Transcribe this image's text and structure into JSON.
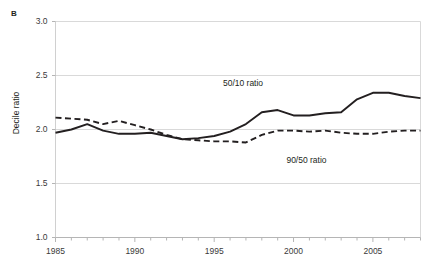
{
  "chart_data": {
    "type": "line",
    "title": "",
    "panel_label": "B",
    "xlabel": "",
    "ylabel": "Decile ratio",
    "xlim": [
      1985,
      2008
    ],
    "ylim": [
      1.0,
      3.0
    ],
    "y_ticks": [
      "1.0",
      "1.5",
      "2.0",
      "2.5",
      "3.0"
    ],
    "y_tick_values": [
      1.0,
      1.5,
      2.0,
      2.5,
      3.0
    ],
    "x_ticks": [
      "1985",
      "1990",
      "1995",
      "2000",
      "2005"
    ],
    "x_tick_values": [
      1985,
      1990,
      1995,
      2000,
      2005
    ],
    "x_minor_tick_interval": 1,
    "grid": "horizontal",
    "legend": "inline-annotations",
    "x": [
      1985,
      1986,
      1987,
      1988,
      1989,
      1990,
      1991,
      1992,
      1993,
      1994,
      1995,
      1996,
      1997,
      1998,
      1999,
      2000,
      2001,
      2002,
      2003,
      2004,
      2005,
      2006,
      2007,
      2008
    ],
    "series": [
      {
        "name": "50/10 ratio",
        "style": "solid",
        "color": "#231f20",
        "label_x": 1997,
        "label_y": 2.43,
        "values": [
          1.97,
          2.0,
          2.05,
          1.99,
          1.96,
          1.96,
          1.97,
          1.94,
          1.91,
          1.92,
          1.94,
          1.98,
          2.05,
          2.16,
          2.18,
          2.13,
          2.13,
          2.15,
          2.16,
          2.28,
          2.34,
          2.34,
          2.31,
          2.29
        ]
      },
      {
        "name": "90/50 ratio",
        "style": "dashed",
        "color": "#231f20",
        "label_x": 2001,
        "label_y": 1.72,
        "values": [
          2.11,
          2.1,
          2.09,
          2.05,
          2.08,
          2.04,
          2.0,
          1.95,
          1.91,
          1.9,
          1.89,
          1.89,
          1.88,
          1.95,
          1.99,
          1.99,
          1.98,
          1.99,
          1.97,
          1.96,
          1.96,
          1.98,
          1.99,
          1.99
        ]
      }
    ]
  }
}
